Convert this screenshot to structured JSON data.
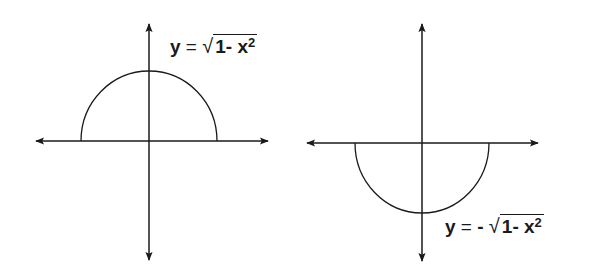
{
  "diagram": {
    "plots": [
      {
        "id": "upper",
        "equation": {
          "lhs": "y",
          "equals": "=",
          "sign": "",
          "radical": "√",
          "radicand_constant": "1",
          "radicand_op": "-",
          "radicand_var": "x",
          "exponent": "2"
        },
        "equation_text": "y = √(1 - x²)",
        "curve": "upper semicircle",
        "origin": [
          149,
          141
        ],
        "x_axis": {
          "from": 34,
          "to": 270
        },
        "y_axis": {
          "from": 22,
          "to": 262
        },
        "radius_x": 68,
        "radius_y": 70
      },
      {
        "id": "lower",
        "equation": {
          "lhs": "y",
          "equals": "=",
          "sign": "-",
          "radical": "√",
          "radicand_constant": "1",
          "radicand_op": "-",
          "radicand_var": "x",
          "exponent": "2"
        },
        "equation_text": "y = -√(1 - x²)",
        "curve": "lower semicircle",
        "origin": [
          422,
          143
        ],
        "x_axis": {
          "from": 305,
          "to": 540
        },
        "y_axis": {
          "from": 22,
          "to": 263
        },
        "radius_x": 68,
        "radius_y": 70
      }
    ],
    "colors": {
      "stroke": "#1a1a1a",
      "background": "#ffffff"
    }
  }
}
